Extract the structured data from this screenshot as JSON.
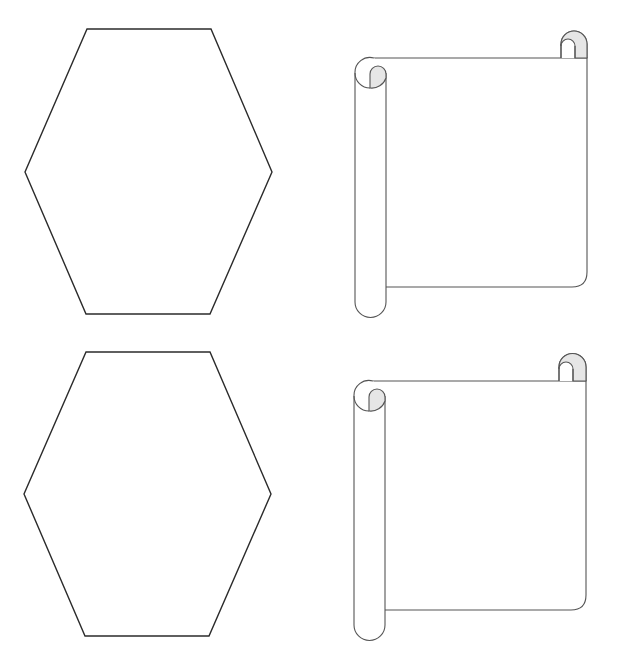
{
  "page": {
    "background_color": "#ffffff"
  },
  "colors": {
    "hexagon_stroke": "#2b2b2b",
    "scroll_stroke": "#555555",
    "scroll_curl_fill": "#e6e6e6"
  },
  "shapes": [
    {
      "id": "hexagon-1",
      "kind": "hexagon-outline",
      "row": 1,
      "column": 1
    },
    {
      "id": "scroll-1",
      "kind": "scroll-banner-outline",
      "row": 1,
      "column": 2
    },
    {
      "id": "hexagon-2",
      "kind": "hexagon-outline",
      "row": 2,
      "column": 1
    },
    {
      "id": "scroll-2",
      "kind": "scroll-banner-outline",
      "row": 2,
      "column": 2
    }
  ]
}
